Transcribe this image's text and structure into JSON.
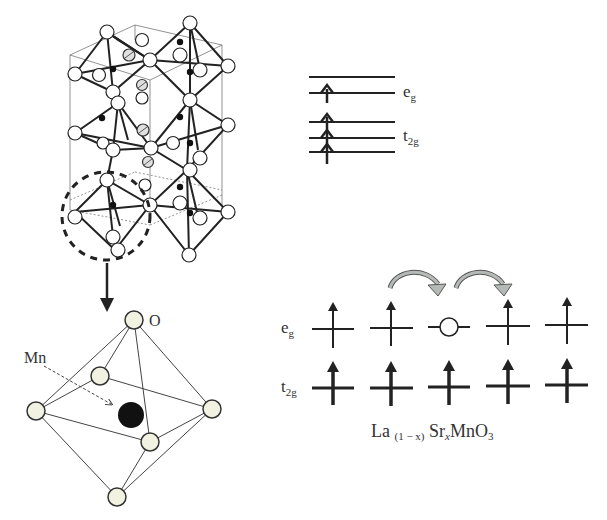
{
  "figure": {
    "crystal_structure": {
      "description": "Perovskite crystal lattice of MnO6 octahedra with unit cell outline",
      "highlight": "dashed circle around one octahedron"
    },
    "octahedron": {
      "label_O": "O",
      "label_Mn": "Mn"
    },
    "energy_levels_single": {
      "eg_label_main": "e",
      "eg_label_sub": "g",
      "t2g_label_main": "t",
      "t2g_label_sub": "2g",
      "eg_levels": 2,
      "eg_electrons": 1,
      "t2g_levels": 3,
      "t2g_electrons": 3
    },
    "hopping_diagram": {
      "eg_label_main": "e",
      "eg_label_sub": "g",
      "t2g_label_main": "t",
      "t2g_label_sub": "2g",
      "sites": [
        {
          "eg": "up"
        },
        {
          "eg": "up"
        },
        {
          "eg": "hole"
        },
        {
          "eg": "up"
        },
        {
          "eg": "up"
        }
      ],
      "hop_arrows": 2,
      "arrow_color": "#a9aeab"
    },
    "formula": {
      "la": "La",
      "la_sub": "(1 − x)",
      "sr": "Sr",
      "sr_sub": "x",
      "rest": "MnO",
      "o_sub": "3"
    }
  }
}
